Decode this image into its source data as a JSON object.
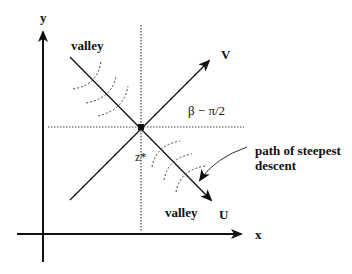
{
  "diagram": {
    "axes": {
      "x_label": "x",
      "y_label": "y"
    },
    "rotated_axes": {
      "u_label": "U",
      "v_label": "V"
    },
    "saddle_point_label": "z*",
    "angle_label": "β − π/2",
    "valley_labels": [
      "valley",
      "valley"
    ],
    "annotation": {
      "line1": "path of steepest",
      "line2": "descent"
    },
    "colors": {
      "ink": "#111111",
      "dotted": "#444444",
      "background": "#ffffff"
    }
  }
}
